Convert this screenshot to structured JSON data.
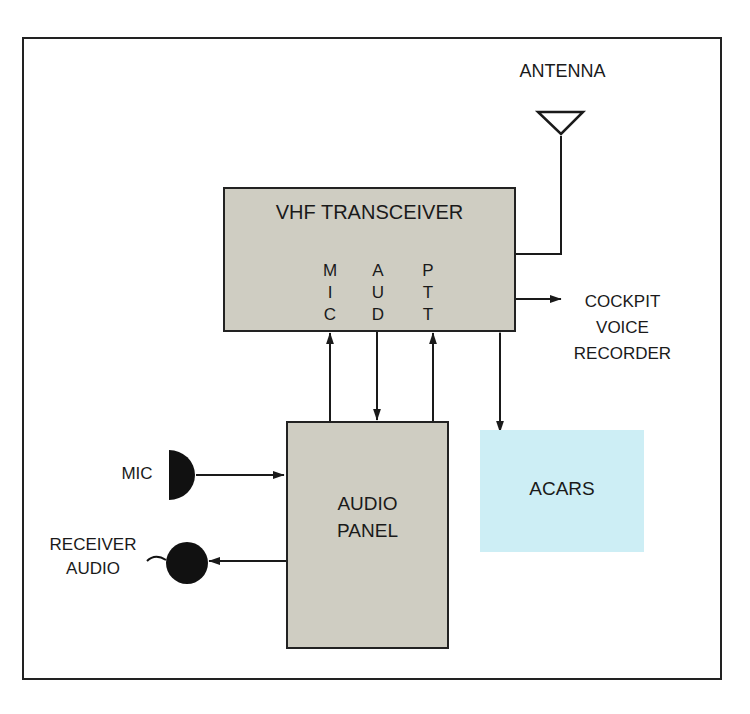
{
  "diagram": {
    "antenna": {
      "label": "ANTENNA"
    },
    "vhf_transceiver": {
      "title": "VHF TRANSCEIVER",
      "ports": [
        {
          "name": "mic",
          "letters": [
            "M",
            "I",
            "C"
          ]
        },
        {
          "name": "aud",
          "letters": [
            "A",
            "U",
            "D"
          ]
        },
        {
          "name": "ptt",
          "letters": [
            "P",
            "T",
            "T"
          ]
        }
      ]
    },
    "cockpit_voice_recorder": {
      "lines": [
        "COCKPIT",
        "VOICE",
        "RECORDER"
      ]
    },
    "audio_panel": {
      "lines": [
        "AUDIO",
        "PANEL"
      ]
    },
    "acars": {
      "label": "ACARS"
    },
    "mic": {
      "label": "MIC"
    },
    "receiver_audio": {
      "lines": [
        "RECEIVER",
        "AUDIO"
      ]
    },
    "colors": {
      "box_fill": "#cfcdc2",
      "acars_fill": "#cdeef5",
      "line": "#1a1a1a"
    }
  }
}
